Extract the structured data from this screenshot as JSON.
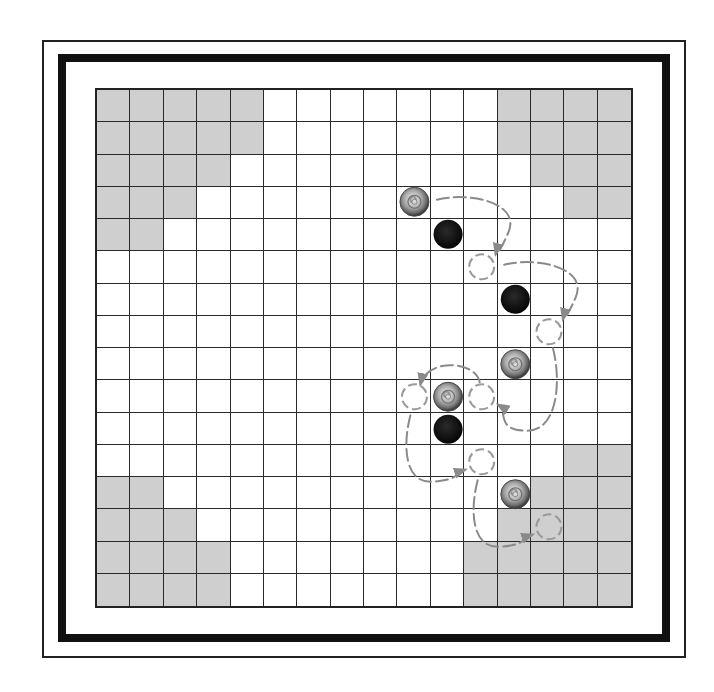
{
  "board": {
    "size": 16,
    "colors": {
      "light_square": "#ffffff",
      "shaded_square": "#cfcfcf",
      "grid_line": "#2a2a2a",
      "frame": "#111111",
      "black_piece": "#111111",
      "gray_piece": "#9a9a9a",
      "arrow": "#8a8a8a",
      "ghost": "#9a9a9a"
    },
    "shaded_regions": [
      {
        "corner": "top-left",
        "cells": [
          [
            0,
            0
          ],
          [
            0,
            1
          ],
          [
            0,
            2
          ],
          [
            0,
            3
          ],
          [
            0,
            4
          ],
          [
            1,
            0
          ],
          [
            1,
            1
          ],
          [
            1,
            2
          ],
          [
            1,
            3
          ],
          [
            1,
            4
          ],
          [
            2,
            0
          ],
          [
            2,
            1
          ],
          [
            2,
            2
          ],
          [
            2,
            3
          ],
          [
            3,
            0
          ],
          [
            3,
            1
          ],
          [
            3,
            2
          ],
          [
            4,
            0
          ],
          [
            4,
            1
          ]
        ]
      },
      {
        "corner": "top-right",
        "cells": [
          [
            0,
            12
          ],
          [
            0,
            13
          ],
          [
            0,
            14
          ],
          [
            0,
            15
          ],
          [
            1,
            12
          ],
          [
            1,
            13
          ],
          [
            1,
            14
          ],
          [
            1,
            15
          ],
          [
            2,
            13
          ],
          [
            2,
            14
          ],
          [
            2,
            15
          ],
          [
            3,
            14
          ],
          [
            3,
            15
          ]
        ]
      },
      {
        "corner": "bottom-left",
        "cells": [
          [
            12,
            0
          ],
          [
            12,
            1
          ],
          [
            13,
            0
          ],
          [
            13,
            1
          ],
          [
            13,
            2
          ],
          [
            14,
            0
          ],
          [
            14,
            1
          ],
          [
            14,
            2
          ],
          [
            14,
            3
          ],
          [
            15,
            0
          ],
          [
            15,
            1
          ],
          [
            15,
            2
          ],
          [
            15,
            3
          ]
        ]
      },
      {
        "corner": "bottom-right",
        "cells": [
          [
            11,
            14
          ],
          [
            11,
            15
          ],
          [
            12,
            13
          ],
          [
            12,
            14
          ],
          [
            12,
            15
          ],
          [
            13,
            12
          ],
          [
            13,
            13
          ],
          [
            13,
            14
          ],
          [
            13,
            15
          ],
          [
            14,
            11
          ],
          [
            14,
            12
          ],
          [
            14,
            13
          ],
          [
            14,
            14
          ],
          [
            14,
            15
          ],
          [
            15,
            11
          ],
          [
            15,
            12
          ],
          [
            15,
            13
          ],
          [
            15,
            14
          ],
          [
            15,
            15
          ]
        ]
      }
    ],
    "pieces": [
      {
        "type": "gray",
        "row": 3,
        "col": 9
      },
      {
        "type": "black",
        "row": 4,
        "col": 10
      },
      {
        "type": "black",
        "row": 6,
        "col": 12
      },
      {
        "type": "gray",
        "row": 8,
        "col": 12
      },
      {
        "type": "gray",
        "row": 9,
        "col": 10
      },
      {
        "type": "black",
        "row": 10,
        "col": 10
      },
      {
        "type": "gray",
        "row": 12,
        "col": 12
      }
    ],
    "ghost_positions": [
      {
        "row": 5,
        "col": 11
      },
      {
        "row": 7,
        "col": 13
      },
      {
        "row": 9,
        "col": 9
      },
      {
        "row": 9,
        "col": 11
      },
      {
        "row": 11,
        "col": 11
      },
      {
        "row": 13,
        "col": 13
      }
    ],
    "jump_arrows": [
      {
        "from": [
          3,
          9
        ],
        "to": [
          5,
          11
        ]
      },
      {
        "from": [
          5,
          11
        ],
        "to": [
          7,
          13
        ]
      },
      {
        "from": [
          7,
          13
        ],
        "to": [
          9,
          11
        ]
      },
      {
        "from": [
          9,
          11
        ],
        "to": [
          9,
          9
        ]
      },
      {
        "from": [
          9,
          9
        ],
        "to": [
          11,
          11
        ]
      },
      {
        "from": [
          11,
          11
        ],
        "to": [
          13,
          13
        ]
      }
    ]
  }
}
